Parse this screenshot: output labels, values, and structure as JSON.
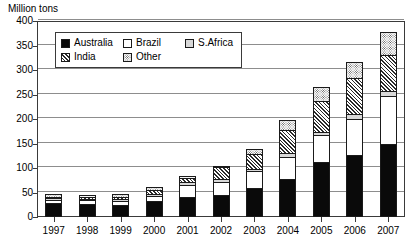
{
  "chart_data": {
    "type": "bar",
    "stacked": true,
    "title": "",
    "subtitle": "",
    "ylabel": "Million tons",
    "xlabel": "",
    "ylim": [
      0,
      400
    ],
    "yticks": [
      0,
      50,
      100,
      150,
      200,
      250,
      300,
      350,
      400
    ],
    "ytick_labels": [
      "0",
      "50",
      "100",
      "150",
      "200",
      "250",
      "300",
      "350",
      "400"
    ],
    "grid": true,
    "legend_position": "upper-left-inside",
    "categories": [
      "1997",
      "1998",
      "1999",
      "2000",
      "2001",
      "2002",
      "2003",
      "2004",
      "2005",
      "2006",
      "2007"
    ],
    "series": [
      {
        "name": "Australia",
        "fill": "solid-black",
        "color": "#0a0a0a",
        "values": [
          29,
          27,
          24,
          33,
          41,
          44,
          60,
          78,
          112,
          127,
          148
        ]
      },
      {
        "name": "Brazil",
        "fill": "white",
        "color": "#ffffff",
        "values": [
          8,
          9,
          10,
          11,
          27,
          30,
          35,
          47,
          58,
          75,
          102
        ]
      },
      {
        "name": "S.Africa",
        "fill": "light-gray",
        "color": "#d8d8d8",
        "values": [
          5,
          5,
          6,
          7,
          8,
          8,
          8,
          10,
          8,
          12,
          12
        ]
      },
      {
        "name": "India",
        "fill": "diagonal-hatch",
        "color": "#2b2b2b",
        "values": [
          6,
          6,
          7,
          10,
          9,
          26,
          32,
          48,
          65,
          75,
          75
        ]
      },
      {
        "name": "Other",
        "fill": "stipple-gray",
        "color": "#808080",
        "values": [
          7,
          6,
          8,
          9,
          7,
          5,
          12,
          23,
          31,
          35,
          48
        ]
      }
    ],
    "totals": [
      55,
      53,
      55,
      70,
      92,
      113,
      147,
      206,
      274,
      324,
      385
    ]
  },
  "legend": {
    "entries": [
      {
        "label": "Australia",
        "swatch": "solid-black-swatch"
      },
      {
        "label": "Brazil",
        "swatch": "white-swatch"
      },
      {
        "label": "S.Africa",
        "swatch": "light-gray-swatch"
      },
      {
        "label": "India",
        "swatch": "diagonal-hatch-swatch"
      },
      {
        "label": "Other",
        "swatch": "stipple-gray-swatch"
      }
    ]
  }
}
